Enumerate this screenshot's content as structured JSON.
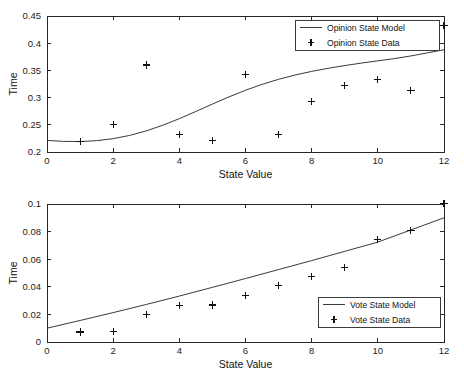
{
  "figure": {
    "background_color": "#ffffff",
    "axis_color": "#262626",
    "line_color": "#3a3a3a",
    "marker_color": "#111111"
  },
  "chart_data": [
    {
      "type": "scatter",
      "panel": "top",
      "title": "",
      "xlabel": "State Value",
      "ylabel": "Time",
      "xlim": [
        0,
        12
      ],
      "ylim": [
        0.2,
        0.45
      ],
      "grid": false,
      "xticks": [
        0,
        2,
        4,
        6,
        8,
        10,
        12
      ],
      "xticklabels": [
        "0",
        "2",
        "4",
        "6",
        "8",
        "10",
        "12"
      ],
      "yticks": [
        0.2,
        0.25,
        0.3,
        0.35,
        0.4,
        0.45
      ],
      "yticklabels": [
        "0.2",
        "0.25",
        "0.3",
        "0.35",
        "0.4",
        "0.45"
      ],
      "legend_position": "upper right",
      "series": [
        {
          "name": "Opinion State Model",
          "style": "line",
          "x": [
            0.0,
            0.5,
            1.0,
            1.5,
            2.0,
            2.5,
            3.0,
            3.5,
            4.0,
            4.5,
            5.0,
            5.5,
            6.0,
            6.5,
            7.0,
            7.5,
            8.0,
            8.5,
            9.0,
            9.5,
            10.0,
            10.5,
            11.0,
            11.5,
            12.0
          ],
          "values": [
            0.2213,
            0.2195,
            0.2192,
            0.2208,
            0.2245,
            0.2305,
            0.2388,
            0.2492,
            0.2613,
            0.2745,
            0.2881,
            0.3013,
            0.3135,
            0.3243,
            0.3336,
            0.3415,
            0.3482,
            0.3539,
            0.3589,
            0.3634,
            0.3676,
            0.3717,
            0.3766,
            0.3822,
            0.388
          ]
        },
        {
          "name": "Opinion State Data",
          "style": "plus",
          "x": [
            1,
            2,
            3,
            4,
            5,
            6,
            7,
            8,
            9,
            10,
            11,
            12
          ],
          "values": [
            0.22,
            0.251,
            0.36,
            0.232,
            0.221,
            0.342,
            0.2325,
            0.2925,
            0.3225,
            0.333,
            0.313,
            0.433
          ]
        }
      ]
    },
    {
      "type": "scatter",
      "panel": "bottom",
      "title": "",
      "xlabel": "State Value",
      "ylabel": "Time",
      "xlim": [
        0,
        12
      ],
      "ylim": [
        0,
        0.1
      ],
      "grid": false,
      "xticks": [
        0,
        2,
        4,
        6,
        8,
        10,
        12
      ],
      "xticklabels": [
        "0",
        "2",
        "4",
        "6",
        "8",
        "10",
        "12"
      ],
      "yticks": [
        0,
        0.02,
        0.04,
        0.06,
        0.08,
        0.1
      ],
      "yticklabels": [
        "0",
        "0.02",
        "0.04",
        "0.06",
        "0.08",
        "0.1"
      ],
      "legend_position": "lower right",
      "series": [
        {
          "name": "Vote State Model",
          "style": "line",
          "x": [
            0.0,
            1.0,
            2.0,
            3.0,
            4.0,
            5.0,
            6.0,
            7.0,
            8.0,
            9.0,
            10.0,
            11.0,
            12.0
          ],
          "values": [
            0.01,
            0.0156,
            0.0213,
            0.0272,
            0.0333,
            0.0396,
            0.046,
            0.0525,
            0.059,
            0.0657,
            0.0724,
            0.0812,
            0.09
          ]
        },
        {
          "name": "Vote State Data",
          "style": "plus",
          "x": [
            1,
            2,
            3,
            4,
            5,
            6,
            7,
            8,
            9,
            10,
            11,
            12
          ],
          "values": [
            0.0073,
            0.0074,
            0.0202,
            0.0267,
            0.0268,
            0.0337,
            0.0407,
            0.0473,
            0.054,
            0.0743,
            0.081,
            0.1003
          ]
        }
      ]
    }
  ]
}
